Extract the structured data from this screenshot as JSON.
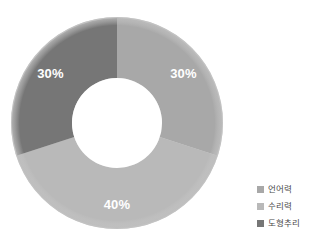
{
  "chart_data": {
    "type": "pie",
    "variant": "donut",
    "title": "",
    "xlabel": "",
    "ylabel": "",
    "categories": [
      "언어력",
      "수리력",
      "도형추리"
    ],
    "values": [
      30,
      40,
      30
    ],
    "value_labels": [
      "30%",
      "40%",
      "30%"
    ],
    "unit": "%",
    "total": 100,
    "start_angle_deg": 0,
    "direction": "clockwise",
    "inner_radius_ratio": 0.43,
    "legend_position": "right",
    "grid": false,
    "slice_colors": [
      "#a8a8a8",
      "#b9b9b9",
      "#767676"
    ],
    "label_color": "#ffffff",
    "rim_color": "#c9c9c9",
    "background_color": "#ffffff",
    "slices": [
      {
        "name": "언어력",
        "value": 30,
        "label": "30%",
        "color": "#a8a8a8",
        "start_deg": 0,
        "end_deg": 108
      },
      {
        "name": "수리력",
        "value": 40,
        "label": "40%",
        "color": "#b9b9b9",
        "start_deg": 108,
        "end_deg": 252
      },
      {
        "name": "도형추리",
        "value": 30,
        "label": "30%",
        "color": "#767676",
        "start_deg": 252,
        "end_deg": 360
      }
    ]
  },
  "legend": {
    "items": [
      {
        "label": "언어력",
        "color": "#a8a8a8"
      },
      {
        "label": "수리력",
        "color": "#b9b9b9"
      },
      {
        "label": "도형추리",
        "color": "#767676"
      }
    ]
  },
  "geometry": {
    "center_x": 117,
    "center_y": 123,
    "outer_radius": 105,
    "inner_radius": 45
  }
}
